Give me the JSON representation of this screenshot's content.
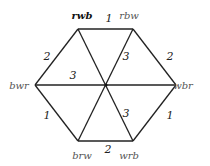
{
  "diagram": {
    "type": "hexagon-graph",
    "center": {
      "x": 106,
      "y": 85
    },
    "vertices": [
      {
        "id": "rwb",
        "label": "rwb",
        "x": 78,
        "y": 29,
        "lx": 82,
        "ly": 19,
        "bold": true
      },
      {
        "id": "rbw",
        "label": "rbw",
        "x": 133,
        "y": 29,
        "lx": 129,
        "ly": 19,
        "bold": false
      },
      {
        "id": "wbr",
        "label": "wbr",
        "x": 176,
        "y": 85,
        "lx": 183,
        "ly": 89,
        "bold": false
      },
      {
        "id": "wrb",
        "label": "wrb",
        "x": 133,
        "y": 141,
        "lx": 129,
        "ly": 159,
        "bold": false
      },
      {
        "id": "brw",
        "label": "brw",
        "x": 78,
        "y": 141,
        "lx": 82,
        "ly": 159,
        "bold": false
      },
      {
        "id": "bwr",
        "label": "bwr",
        "x": 35,
        "y": 85,
        "lx": 19,
        "ly": 89,
        "bold": false
      }
    ],
    "edges": [
      {
        "from": "rwb",
        "to": "rbw",
        "label": "1",
        "lx": 109,
        "ly": 22
      },
      {
        "from": "rbw",
        "to": "wbr",
        "label": "2",
        "lx": 170,
        "ly": 60
      },
      {
        "from": "wbr",
        "to": "wrb",
        "label": "1",
        "lx": 170,
        "ly": 119
      },
      {
        "from": "wrb",
        "to": "brw",
        "label": "2",
        "lx": 108,
        "ly": 153
      },
      {
        "from": "brw",
        "to": "bwr",
        "label": "1",
        "lx": 47,
        "ly": 119
      },
      {
        "from": "bwr",
        "to": "rwb",
        "label": "2",
        "lx": 47,
        "ly": 60
      },
      {
        "from": "bwr",
        "to": "wbr",
        "label": "3",
        "lx": 73,
        "ly": 79
      },
      {
        "from": "rwb",
        "to": "wrb",
        "label": "3",
        "lx": 126,
        "ly": 117
      },
      {
        "from": "rbw",
        "to": "brw",
        "label": "3",
        "lx": 126,
        "ly": 60
      }
    ]
  }
}
